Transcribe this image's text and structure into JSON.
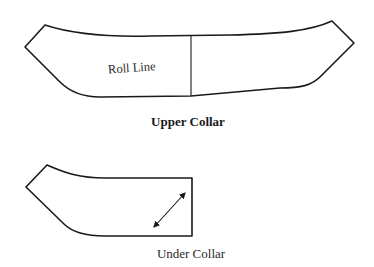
{
  "upper_collar": {
    "caption": "Upper Collar",
    "roll_line_label": "Roll Line"
  },
  "under_collar": {
    "caption": "Under Collar",
    "grainline_icon": "double-arrow-grainline"
  },
  "colors": {
    "stroke": "#1a1a1a",
    "background": "#ffffff"
  }
}
